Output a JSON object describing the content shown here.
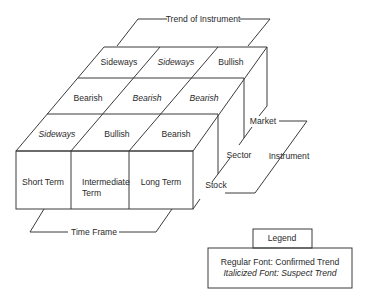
{
  "title_bracket": {
    "label": "Trend of Instrument"
  },
  "time_frame_bracket": {
    "label": "Time Frame"
  },
  "instrument_bracket": {
    "label": "Instrument"
  },
  "instrument_levels": [
    "Stock",
    "Sector",
    "Market"
  ],
  "time_frames": [
    "Short Term",
    "Intermediate",
    "Term",
    "Long Term"
  ],
  "grid": {
    "market_row": [
      {
        "label": "Sideways",
        "style": "regular"
      },
      {
        "label": "Sideways",
        "style": "italic"
      },
      {
        "label": "Bullish",
        "style": "regular"
      }
    ],
    "sector_row": [
      {
        "label": "Bearish",
        "style": "regular"
      },
      {
        "label": "Bearish",
        "style": "italic"
      },
      {
        "label": "Bearish",
        "style": "italic"
      }
    ],
    "stock_row": [
      {
        "label": "Sideways",
        "style": "italic"
      },
      {
        "label": "Bullish",
        "style": "regular"
      },
      {
        "label": "Bearish",
        "style": "regular"
      }
    ]
  },
  "legend": {
    "title": "Legend",
    "regular_line": "Regular Font: Confirmed Trend",
    "italic_line": "Italicized Font: Suspect Trend"
  }
}
